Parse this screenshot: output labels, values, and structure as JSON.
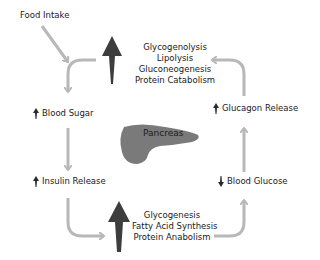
{
  "diagram": {
    "title_input": "Food Intake",
    "nodes": {
      "blood_sugar": {
        "label": "Blood Sugar",
        "direction": "up"
      },
      "insulin_release": {
        "label": "Insulin Release",
        "direction": "up"
      },
      "glucagon_release": {
        "label": "Glucagon Release",
        "direction": "up"
      },
      "blood_glucose": {
        "label": "Blood Glucose",
        "direction": "down"
      }
    },
    "organ": {
      "label": "Pancreas",
      "color": "#7a7a7a"
    },
    "catabolic_block": {
      "direction": "up",
      "lines": [
        "Glycogenolysis",
        "Lipolysis",
        "Gluconeogenesis",
        "Protein Catabolism"
      ]
    },
    "anabolic_block": {
      "direction": "up",
      "lines": [
        "Glycogenesis",
        "Fatty Acid Synthesis",
        "Protein Anabolism"
      ]
    },
    "colors": {
      "flow_arrow": "#b8b8b8",
      "big_arrow": "#3d3d3d",
      "text": "#1a1a1a"
    }
  }
}
